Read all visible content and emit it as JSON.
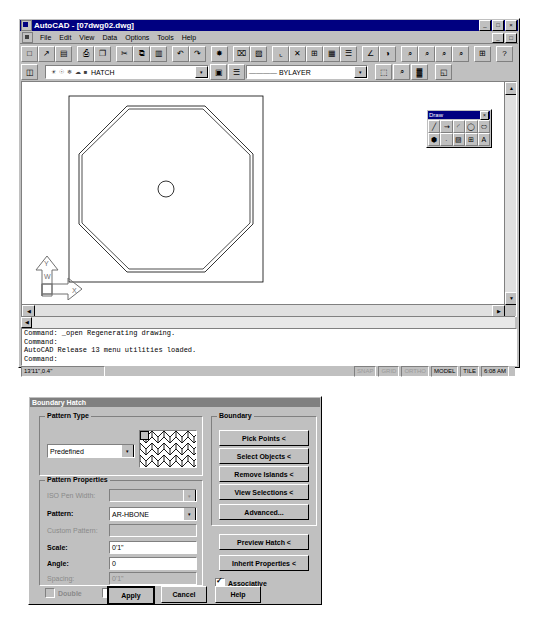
{
  "window": {
    "title": "AutoCAD - [07dwg02.dwg]",
    "min_label": "_",
    "max_label": "□",
    "close_label": "×",
    "doc_min_label": "_",
    "doc_max_label": "□",
    "doc_close_label": "×"
  },
  "menu": {
    "items": [
      {
        "label": "File"
      },
      {
        "label": "Edit"
      },
      {
        "label": "View"
      },
      {
        "label": "Data"
      },
      {
        "label": "Options"
      },
      {
        "label": "Tools"
      },
      {
        "label": "Help"
      }
    ]
  },
  "toolbar": {
    "buttons": [
      {
        "name": "new-icon",
        "glyph": "□"
      },
      {
        "name": "open-icon",
        "glyph": "↗"
      },
      {
        "name": "save-icon",
        "glyph": "▤"
      },
      {
        "name": "print-icon",
        "glyph": "⎙"
      },
      {
        "name": "print-preview-icon",
        "glyph": "❐"
      },
      {
        "name": "cut-icon",
        "glyph": "✂"
      },
      {
        "name": "copy-icon",
        "glyph": "⧉"
      },
      {
        "name": "paste-icon",
        "glyph": "▥"
      },
      {
        "name": "undo-icon",
        "glyph": "↶"
      },
      {
        "name": "redo-icon",
        "glyph": "↷"
      },
      {
        "name": "osnap-icon",
        "glyph": "✸"
      },
      {
        "name": "select-window-icon",
        "glyph": "⌧"
      },
      {
        "name": "select-object-icon",
        "glyph": "▨"
      },
      {
        "name": "ucs-icon",
        "glyph": "⌞"
      },
      {
        "name": "ucs-x-icon",
        "glyph": "✕"
      },
      {
        "name": "tiled-viewports-icon",
        "glyph": "⊞"
      },
      {
        "name": "mspace-icon",
        "glyph": "▦"
      },
      {
        "name": "pspace-icon",
        "glyph": "☰"
      },
      {
        "name": "dist-icon",
        "glyph": "∠"
      },
      {
        "name": "render-icon",
        "glyph": "◑"
      },
      {
        "name": "zoom-window-icon",
        "glyph": "⌕"
      },
      {
        "name": "zoom-out-icon",
        "glyph": "⌕"
      },
      {
        "name": "zoom-in-icon",
        "glyph": "⌕"
      },
      {
        "name": "zoom-all-icon",
        "glyph": "⌕"
      },
      {
        "name": "zoom-extents-icon",
        "glyph": "⊞"
      },
      {
        "name": "help-icon",
        "glyph": "?"
      }
    ]
  },
  "properties_bar": {
    "layer_button_icon": "layer-stack-icon",
    "layer_state_icons": [
      "lightbulb-icon",
      "sun-icon",
      "snowflake-icon",
      "thaw-icon",
      "lock-icon"
    ],
    "layer_value": "HATCH",
    "dropdown_arrow": "▾",
    "color_icon": "color-swatch-icon",
    "linetype_preview_icon": "linetype-line-icon",
    "linetype_value": "BYLAYER",
    "right_buttons": [
      {
        "name": "layer-control-icon",
        "glyph": "⬚"
      },
      {
        "name": "object-properties-icon",
        "glyph": "⌕"
      },
      {
        "name": "match-properties-icon",
        "glyph": "▓"
      },
      {
        "name": "properties-icon",
        "glyph": "◱"
      }
    ]
  },
  "draw_toolbar": {
    "title": "Draw",
    "close_label": "×",
    "buttons": [
      {
        "name": "line-icon",
        "glyph": "╱"
      },
      {
        "name": "polyline-icon",
        "glyph": "⇝"
      },
      {
        "name": "arc-icon",
        "glyph": "◜"
      },
      {
        "name": "circle-icon",
        "glyph": "◯"
      },
      {
        "name": "ellipse-icon",
        "glyph": "⬭"
      },
      {
        "name": "polygon-icon",
        "glyph": "⬢"
      },
      {
        "name": "point-icon",
        "glyph": "∙"
      },
      {
        "name": "hatch-icon",
        "glyph": "▨"
      },
      {
        "name": "block-insert-icon",
        "glyph": "⊞"
      },
      {
        "name": "text-icon",
        "glyph": "A"
      }
    ]
  },
  "canvas": {
    "ucs_x_label": "X",
    "ucs_y_label": "Y",
    "ucs_origin_label": "W",
    "shape": "octagon-with-center-circle"
  },
  "command_window": {
    "lines": [
      "Command: _open Regenerating drawing.",
      "Command:",
      "AutoCAD Release 13 menu utilities loaded.",
      "Command:"
    ]
  },
  "status_bar": {
    "coordinates": "13'11\",0.4\"",
    "snap": "SNAP",
    "grid": "GRID",
    "ortho": "ORTHO",
    "model": "MODEL",
    "tile": "TILE",
    "time": "6:08 AM"
  },
  "dialog": {
    "title": "Boundary Hatch",
    "pattern_type": {
      "group_label": "Pattern Type",
      "select_value": "Predefined",
      "dropdown_arrow": "▾",
      "preview_name": "hatch-preview-swatch"
    },
    "pattern_properties": {
      "group_label": "Pattern Properties",
      "iso_pen_width_label": "ISO Pen Width:",
      "iso_pen_width_value": "",
      "pattern_label": "Pattern:",
      "pattern_value": "AR-HBONE",
      "custom_pattern_label": "Custom Pattern:",
      "custom_pattern_value": "",
      "scale_label": "Scale:",
      "scale_value": "0'1\"",
      "angle_label": "Angle:",
      "angle_value": "0",
      "spacing_label": "Spacing:",
      "spacing_value": "0'1\"",
      "double_label": "Double",
      "exploded_label": "Exploded"
    },
    "boundary": {
      "group_label": "Boundary",
      "pick_points": "Pick Points <",
      "select_objects": "Select Objects <",
      "remove_islands": "Remove Islands <",
      "view_selections": "View Selections <",
      "advanced": "Advanced...",
      "preview_hatch": "Preview Hatch <",
      "inherit_properties": "Inherit Properties <",
      "associative_label": "Associative"
    },
    "footer": {
      "apply": "Apply",
      "cancel": "Cancel",
      "help": "Help"
    }
  }
}
